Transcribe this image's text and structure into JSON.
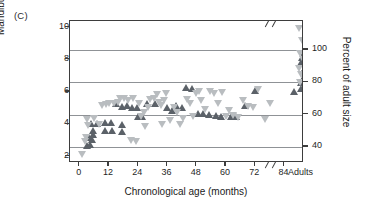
{
  "panel": {
    "label": "(C)"
  },
  "chart_data": {
    "type": "scatter",
    "title": "",
    "xlabel": "Chronological age (months)",
    "ylabel": "Mandibular depth (cm)",
    "ylabel_right": "Percent of adult size",
    "xticks": [
      "0",
      "12",
      "24",
      "36",
      "48",
      "60",
      "72",
      "84",
      "Adults"
    ],
    "yticks_left": [
      "2",
      "4",
      "6",
      "8",
      "10"
    ],
    "yticks_right": [
      "40",
      "60",
      "80",
      "100"
    ],
    "ylim": [
      1.6,
      10.4
    ],
    "ylim_right": [
      30,
      118
    ],
    "xlim": [
      -4,
      92
    ],
    "grid": "horizontal gridlines at right-axis ticks 40, 60, 80, 100",
    "axis_break_x": "between 84 months and Adults",
    "axis_break_top": "two slashes on top border near right",
    "legend": "none",
    "colors": {
      "up_triangle": "#5b6168",
      "down_triangle": "#b9bdc0",
      "frame": "#3d3d3d",
      "grid": "#8f9296"
    },
    "series": [
      {
        "name": "up-triangle",
        "marker": "triangle-up",
        "color": "#5b6168",
        "points": [
          [
            3.2,
            2.65
          ],
          [
            4.4,
            2.75
          ],
          [
            5.0,
            3.05
          ],
          [
            4.0,
            3.15
          ],
          [
            5.6,
            3.35
          ],
          [
            5.4,
            3.6
          ],
          [
            4.6,
            4.05
          ],
          [
            7.0,
            4.05
          ],
          [
            10.4,
            4.1
          ],
          [
            13.0,
            4.1
          ],
          [
            10.6,
            3.6
          ],
          [
            13.2,
            3.6
          ],
          [
            17.2,
            4.0
          ],
          [
            17.6,
            3.55
          ],
          [
            14.8,
            5.25
          ],
          [
            17.4,
            5.1
          ],
          [
            19.6,
            5.15
          ],
          [
            21.4,
            5.05
          ],
          [
            24.0,
            4.5
          ],
          [
            25.6,
            4.45
          ],
          [
            23.4,
            5.0
          ],
          [
            27.6,
            5.25
          ],
          [
            31.0,
            5.25
          ],
          [
            36.0,
            5.0
          ],
          [
            38.0,
            4.85
          ],
          [
            39.6,
            5.15
          ],
          [
            42.0,
            5.05
          ],
          [
            43.6,
            6.3
          ],
          [
            46.0,
            6.2
          ],
          [
            48.6,
            4.65
          ],
          [
            50.8,
            4.65
          ],
          [
            53.0,
            4.6
          ],
          [
            56.0,
            4.55
          ],
          [
            58.0,
            4.5
          ],
          [
            62.0,
            4.45
          ],
          [
            64.0,
            4.45
          ],
          [
            68.0,
            5.15
          ],
          [
            72.0,
            6.1
          ],
          [
            88.0,
            6.0
          ],
          [
            91.0,
            6.2
          ],
          [
            91.6,
            6.85
          ],
          [
            92.2,
            7.4
          ],
          [
            90.8,
            7.8
          ],
          [
            91.4,
            8.1
          ],
          [
            92.0,
            8.5
          ],
          [
            91.0,
            6.55
          ],
          [
            92.4,
            6.3
          ]
        ]
      },
      {
        "name": "down-triangle",
        "marker": "triangle-down",
        "color": "#b9bdc0",
        "points": [
          [
            1.0,
            2.1
          ],
          [
            2.2,
            2.95
          ],
          [
            2.6,
            3.2
          ],
          [
            3.0,
            4.3
          ],
          [
            3.6,
            3.9
          ],
          [
            6.0,
            4.35
          ],
          [
            8.0,
            4.0
          ],
          [
            9.0,
            5.15
          ],
          [
            11.0,
            5.2
          ],
          [
            12.2,
            5.25
          ],
          [
            14.0,
            5.3
          ],
          [
            15.6,
            5.35
          ],
          [
            16.4,
            5.6
          ],
          [
            18.4,
            5.6
          ],
          [
            20.0,
            5.45
          ],
          [
            21.0,
            3.0
          ],
          [
            23.0,
            2.95
          ],
          [
            22.0,
            5.6
          ],
          [
            24.4,
            5.25
          ],
          [
            25.0,
            4.5
          ],
          [
            26.6,
            4.75
          ],
          [
            28.0,
            5.0
          ],
          [
            27.0,
            3.85
          ],
          [
            29.0,
            5.55
          ],
          [
            30.4,
            5.6
          ],
          [
            31.6,
            5.85
          ],
          [
            32.6,
            5.35
          ],
          [
            33.4,
            5.15
          ],
          [
            34.6,
            5.45
          ],
          [
            35.6,
            5.9
          ],
          [
            34.0,
            4.0
          ],
          [
            37.0,
            4.2
          ],
          [
            38.6,
            5.05
          ],
          [
            40.0,
            4.7
          ],
          [
            41.0,
            3.95
          ],
          [
            42.6,
            4.35
          ],
          [
            44.0,
            5.5
          ],
          [
            45.4,
            5.3
          ],
          [
            46.6,
            4.45
          ],
          [
            47.6,
            5.9
          ],
          [
            49.0,
            6.05
          ],
          [
            50.0,
            5.45
          ],
          [
            51.6,
            4.9
          ],
          [
            53.6,
            6.05
          ],
          [
            55.0,
            5.9
          ],
          [
            56.6,
            5.3
          ],
          [
            58.4,
            5.95
          ],
          [
            60.0,
            4.45
          ],
          [
            61.4,
            4.85
          ],
          [
            63.0,
            4.55
          ],
          [
            65.0,
            4.4
          ],
          [
            67.0,
            5.45
          ],
          [
            69.0,
            5.1
          ],
          [
            71.0,
            5.0
          ],
          [
            73.0,
            6.15
          ],
          [
            76.0,
            4.3
          ],
          [
            78.0,
            5.3
          ],
          [
            90.0,
            9.95
          ],
          [
            91.2,
            9.2
          ],
          [
            90.4,
            8.35
          ],
          [
            91.8,
            8.0
          ],
          [
            90.2,
            7.45
          ],
          [
            91.0,
            7.05
          ],
          [
            90.6,
            6.6
          ]
        ]
      }
    ]
  }
}
